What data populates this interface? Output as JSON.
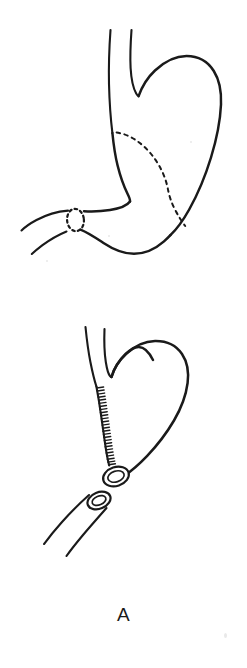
{
  "figure": {
    "label": "A",
    "background_color": "#ffffff",
    "ink_color": "#1a1a1a",
    "width": 247,
    "height": 668,
    "panels": [
      {
        "id": "upper",
        "name": "intact-stomach-with-resection-lines",
        "caption": "",
        "structures": [
          "esophagus",
          "gastric-fundus",
          "greater-curvature",
          "lesser-curvature",
          "gastric-antrum",
          "pylorus",
          "duodenum",
          "dashed-resection-line",
          "dashed-pyloric-transection-ring"
        ]
      },
      {
        "id": "lower",
        "name": "post-resection-gastric-remnant-and-duodenal-stump",
        "caption": "",
        "structures": [
          "esophagus",
          "gastric-remnant",
          "staple-suture-line",
          "gastric-remnant-lumen",
          "duodenal-stump",
          "duodenal-stump-lumen"
        ]
      }
    ]
  },
  "annotations": {
    "staple_tick_count": 26,
    "resection_dash_pattern": "3.6 4.4",
    "pylorus_dash_pattern": "2.6 3.2"
  }
}
